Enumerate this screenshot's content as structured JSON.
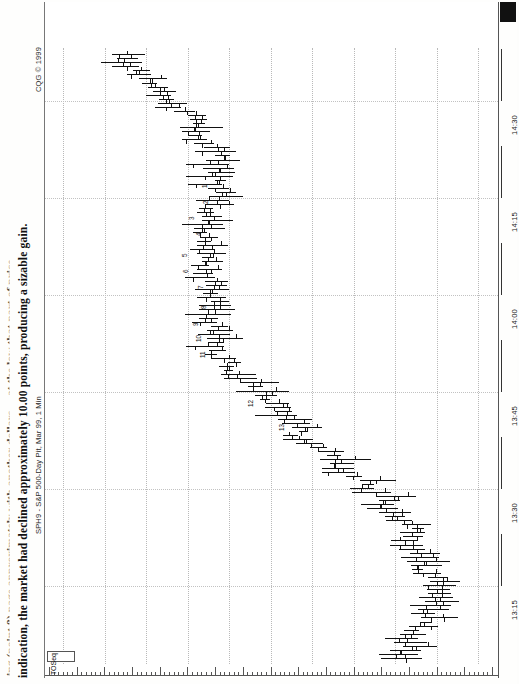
{
  "page": {
    "body_text_cutoff": "ing (point 8) page approximately  with another dollars ... at the low that part of price",
    "body_text": "indication, the market had declined approximately 10.00 points, producing a sizable gain."
  },
  "chart": {
    "source_label": "SPH9 - S&P 500-Day Pit, Mar 99, 1 Min",
    "copyright": "CQG © 1999",
    "study_tag": "TOSeq",
    "symbol": "SPH9",
    "interval": "1 Min",
    "colors": {
      "bar": "#111111",
      "grid": "#bdbdbd",
      "frame": "#666666",
      "background": "#ffffff",
      "marker": "#111111"
    }
  },
  "chart_data": {
    "type": "bar",
    "subtype": "ohlc-bar-chart",
    "title": "SPH9 - S&P 500-Day Pit, Mar 99, 1 Min",
    "orientation": "rotated-90",
    "xlabel": "Time",
    "ylabel": "Price",
    "grid": true,
    "legend": "none",
    "price_ticks": [
      "128900",
      "128800",
      "128700",
      "128600",
      "128500",
      "128400",
      "128300",
      "128200",
      "128100",
      "128000",
      "127900"
    ],
    "price_range": [
      127900,
      128900
    ],
    "time_ticks": [
      "14:30",
      "14:15",
      "14:00",
      "13:45",
      "13:30",
      "13:15"
    ],
    "time_range": [
      "13:10",
      "14:40"
    ],
    "annotations": [
      "1",
      "2",
      "3",
      "4",
      "5",
      "6",
      "7",
      "8",
      "9",
      "10",
      "11",
      "12",
      "13"
    ],
    "bars": [
      {
        "t": 0,
        "open": 128247,
        "high": 128268,
        "low": 128234,
        "close": 128255
      },
      {
        "t": 1,
        "open": 128258,
        "high": 128282,
        "low": 128243,
        "close": 128274
      },
      {
        "t": 2,
        "open": 128276,
        "high": 128296,
        "low": 128262,
        "close": 128288
      },
      {
        "t": 3,
        "open": 128290,
        "high": 128310,
        "low": 128278,
        "close": 128300
      },
      {
        "t": 4,
        "open": 128300,
        "high": 128324,
        "low": 128290,
        "close": 128316
      },
      {
        "t": 5,
        "open": 128316,
        "high": 128340,
        "low": 128305,
        "close": 128330
      },
      {
        "t": 6,
        "open": 128330,
        "high": 128352,
        "low": 128320,
        "close": 128344
      },
      {
        "t": 7,
        "open": 128344,
        "high": 128368,
        "low": 128334,
        "close": 128360
      },
      {
        "t": 8,
        "open": 128360,
        "high": 128380,
        "low": 128350,
        "close": 128372
      },
      {
        "t": 9,
        "open": 128372,
        "high": 128398,
        "low": 128362,
        "close": 128390
      },
      {
        "t": 10,
        "open": 128390,
        "high": 128412,
        "low": 128378,
        "close": 128402
      },
      {
        "t": 11,
        "open": 128402,
        "high": 128424,
        "low": 128392,
        "close": 128414
      },
      {
        "t": 12,
        "open": 128414,
        "high": 128438,
        "low": 128404,
        "close": 128428
      },
      {
        "t": 13,
        "open": 128428,
        "high": 128450,
        "low": 128418,
        "close": 128440
      },
      {
        "t": 14,
        "open": 128440,
        "high": 128462,
        "low": 128430,
        "close": 128452
      },
      {
        "t": 15,
        "open": 128452,
        "high": 128476,
        "low": 128442,
        "close": 128466
      },
      {
        "t": 16,
        "open": 128466,
        "high": 128488,
        "low": 128456,
        "close": 128478
      },
      {
        "t": 17,
        "open": 128478,
        "high": 128500,
        "low": 128468,
        "close": 128492
      },
      {
        "t": 18,
        "open": 128492,
        "high": 128514,
        "low": 128482,
        "close": 128504
      },
      {
        "t": 19,
        "open": 128504,
        "high": 128526,
        "low": 128494,
        "close": 128518
      },
      {
        "t": 20,
        "open": 128518,
        "high": 128540,
        "low": 128508,
        "close": 128530
      }
    ]
  }
}
